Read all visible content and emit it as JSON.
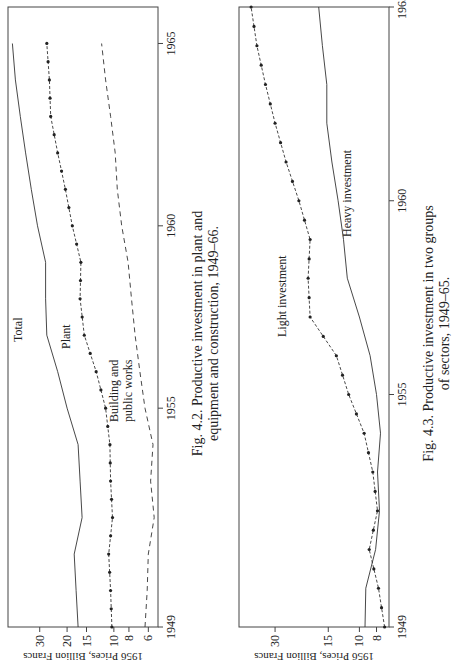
{
  "chart_data": [
    {
      "type": "line",
      "figure_id": "Fig. 4.2.",
      "title": "Productive investment in plant and equipment and construction, 1949–66.",
      "caption_line1": "Fig. 4.2.  Productive investment in plant and",
      "caption_line2": "equipment and construction, 1949–66.",
      "xlabel": "",
      "ylabel": "1956 Prices, Billion Francs",
      "yscale": "log",
      "x": [
        1949,
        1950,
        1951,
        1952,
        1953,
        1954,
        1955,
        1956,
        1957,
        1958,
        1959,
        1960,
        1961,
        1962,
        1963,
        1964,
        1965
      ],
      "xticks": [
        "1949",
        "1955",
        "1960",
        "1965"
      ],
      "yticks": [
        "6",
        "8",
        "10",
        "15",
        "20",
        "30"
      ],
      "ylim": [
        5.2,
        48
      ],
      "xlim": [
        1949,
        1966
      ],
      "series": [
        {
          "name": "Total",
          "style": "solid",
          "values": [
            17,
            17.5,
            18,
            16,
            16.5,
            17,
            20,
            23,
            27,
            27.5,
            27.5,
            31,
            34,
            37,
            40,
            43,
            45
          ]
        },
        {
          "name": "Plant",
          "style": "dotted-markers",
          "values": [
            10.3,
            10.5,
            10.8,
            10.2,
            10.5,
            10.6,
            11.3,
            13,
            15.5,
            16.5,
            16.3,
            18.5,
            20.5,
            23,
            25.5,
            26,
            27
          ]
        },
        {
          "name": "Building and public works",
          "style": "dashed",
          "values": [
            6.3,
            6.1,
            6.0,
            5.5,
            5.8,
            5.6,
            6.3,
            6.8,
            7.3,
            7.7,
            8.1,
            8.9,
            9.5,
            9.8,
            10.5,
            11.3,
            12
          ]
        }
      ],
      "annotations": [
        "Total",
        "Plant",
        "Building and",
        "public works"
      ]
    },
    {
      "type": "line",
      "figure_id": "Fig. 4.3.",
      "title": "Productive investment in two groups of sectors, 1949–65.",
      "caption_line1": "Fig. 4.3.  Productive investment in two groups",
      "caption_line2": "of sectors, 1949–65.",
      "xlabel": "",
      "ylabel": "1956 Prices, Billion Francs",
      "yscale": "log",
      "x": [
        1949,
        1950,
        1951,
        1952,
        1953,
        1954,
        1955,
        1956,
        1957,
        1958,
        1959,
        1960,
        1961,
        1962,
        1963,
        1964,
        1965
      ],
      "xticks": [
        "1949",
        "1955",
        "1960",
        "1965"
      ],
      "yticks": [
        "8",
        "10",
        "15",
        "30"
      ],
      "ylim": [
        6.8,
        48
      ],
      "xlim": [
        1949,
        1965
      ],
      "series": [
        {
          "name": "Light investment",
          "style": "dotted-markers",
          "values": [
            7.2,
            7.8,
            8.8,
            7.9,
            8.4,
            9.4,
            11.5,
            13.5,
            19,
            19.5,
            19,
            22,
            26,
            30,
            34,
            38,
            41
          ]
        },
        {
          "name": "Heavy investment",
          "style": "solid",
          "values": [
            9.3,
            9.2,
            8.1,
            7.7,
            7.9,
            7.6,
            8.0,
            8.7,
            10.0,
            11.7,
            12.3,
            13.2,
            14.3,
            15.3,
            15.3,
            16.2,
            17
          ]
        }
      ],
      "annotations": [
        "Light investment",
        "Heavy investment"
      ]
    }
  ]
}
